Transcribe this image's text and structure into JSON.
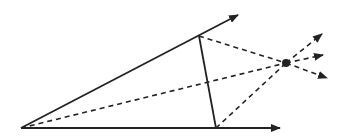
{
  "diagram": {
    "type": "geometric-construction",
    "colors": {
      "stroke": "#222222",
      "background": "#ffffff"
    },
    "points": {
      "O": [
        21,
        128
      ],
      "A": [
        199,
        36
      ],
      "B": [
        216,
        128
      ],
      "P": [
        286,
        63
      ]
    },
    "solid_lines": [
      {
        "name": "upper-ray",
        "from": [
          21,
          128
        ],
        "to": [
          238,
          15
        ],
        "arrow": true
      },
      {
        "name": "lower-ray",
        "from": [
          21,
          128
        ],
        "to": [
          280,
          128
        ],
        "arrow": true
      },
      {
        "name": "segment-ab",
        "from": [
          199,
          36
        ],
        "to": [
          216,
          128
        ],
        "arrow": false
      }
    ],
    "dashed_lines": [
      {
        "name": "dashed-o-to-p",
        "from": [
          21,
          128
        ],
        "to": [
          286,
          63
        ],
        "arrow": false
      },
      {
        "name": "dashed-a-to-p",
        "from": [
          199,
          36
        ],
        "to": [
          286,
          63
        ],
        "arrow": false
      },
      {
        "name": "dashed-b-to-p",
        "from": [
          216,
          128
        ],
        "to": [
          286,
          63
        ],
        "arrow": false
      },
      {
        "name": "dashed-p-out-upper",
        "from": [
          286,
          63
        ],
        "to": [
          322,
          34
        ],
        "arrow": true
      },
      {
        "name": "dashed-p-out-middle",
        "from": [
          286,
          63
        ],
        "to": [
          323,
          55
        ],
        "arrow": true
      },
      {
        "name": "dashed-p-out-lower",
        "from": [
          286,
          63
        ],
        "to": [
          327,
          78
        ],
        "arrow": true
      }
    ],
    "dot": {
      "name": "intersection-point",
      "at": [
        286,
        63
      ],
      "r": 4
    }
  }
}
